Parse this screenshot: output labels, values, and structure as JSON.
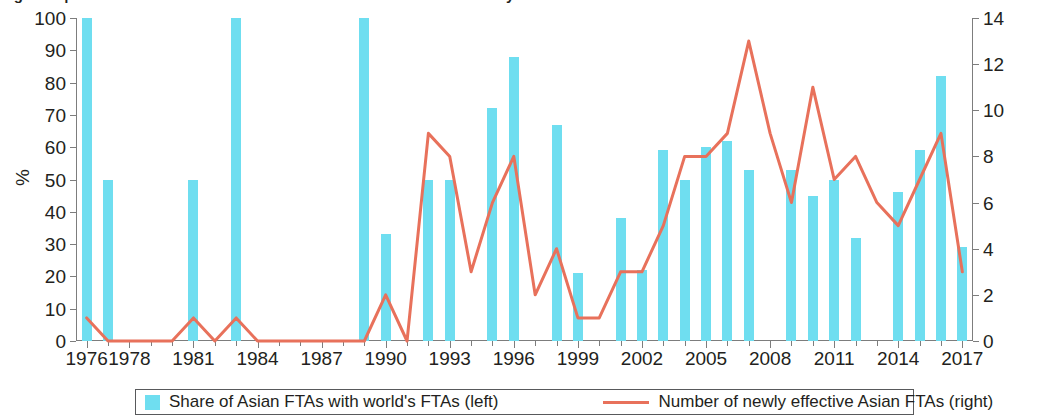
{
  "figure": {
    "title_partial": "Figure 3 | Share of Asian FTAs with world's FTAs and number of newly effective Asian FTAs"
  },
  "axes": {
    "y_left_title": "%",
    "y_left_ticks": [
      "0",
      "10",
      "20",
      "30",
      "40",
      "50",
      "60",
      "70",
      "80",
      "90",
      "100"
    ],
    "y_right_ticks": [
      "0",
      "2",
      "4",
      "6",
      "8",
      "10",
      "12",
      "14"
    ],
    "x_ticks": [
      "1976",
      "1978",
      "1981",
      "1984",
      "1987",
      "1990",
      "1993",
      "1996",
      "1999",
      "2002",
      "2005",
      "2008",
      "2011",
      "2014",
      "2017"
    ]
  },
  "legend": {
    "bar_label": "Share of Asian FTAs with world's FTAs (left)",
    "line_label": "Number of newly effective Asian FTAs (right)"
  },
  "colors": {
    "bar": "#6fdef0",
    "line": "#e8715b",
    "axis": "#7d7d7d",
    "text": "#231f20",
    "legend_border": "#58595b"
  },
  "chart_data": {
    "type": "bar",
    "title": "Share of Asian FTAs with world's FTAs and number of newly effective Asian FTAs",
    "xlabel": "",
    "ylabel": "%",
    "y2label": "",
    "ylim": [
      0,
      100
    ],
    "y2lim": [
      0,
      14
    ],
    "grid": false,
    "legend_position": "bottom",
    "categories": [
      "1976",
      "1977",
      "1978",
      "1979",
      "1980",
      "1981",
      "1982",
      "1983",
      "1984",
      "1985",
      "1986",
      "1987",
      "1988",
      "1989",
      "1990",
      "1991",
      "1992",
      "1993",
      "1994",
      "1995",
      "1996",
      "1997",
      "1998",
      "1999",
      "2000",
      "2001",
      "2002",
      "2003",
      "2004",
      "2005",
      "2006",
      "2007",
      "2008",
      "2009",
      "2010",
      "2011",
      "2012",
      "2013",
      "2014",
      "2015",
      "2016",
      "2017"
    ],
    "series": [
      {
        "name": "Share of Asian FTAs with world's FTAs (left)",
        "type": "bar",
        "axis": "left",
        "unit": "%",
        "color": "#6fdef0",
        "values": [
          100,
          50,
          0,
          0,
          0,
          50,
          0,
          100,
          0,
          0,
          0,
          0,
          0,
          100,
          33,
          0,
          50,
          50,
          0,
          72,
          88,
          0,
          67,
          21,
          0,
          38,
          22,
          59,
          50,
          60,
          62,
          53,
          0,
          53,
          45,
          50,
          32,
          0,
          46,
          59,
          82,
          29
        ]
      },
      {
        "name": "Number of newly effective Asian FTAs (right)",
        "type": "line",
        "axis": "right",
        "unit": "count",
        "color": "#e8715b",
        "values": [
          1,
          0,
          0,
          0,
          0,
          1,
          0,
          1,
          0,
          0,
          0,
          0,
          0,
          0,
          2,
          0,
          9,
          8,
          3,
          6,
          8,
          2,
          4,
          1,
          1,
          3,
          3,
          5,
          8,
          8,
          9,
          13,
          9,
          6,
          11,
          7,
          8,
          6,
          5,
          7,
          9,
          3
        ]
      }
    ]
  }
}
